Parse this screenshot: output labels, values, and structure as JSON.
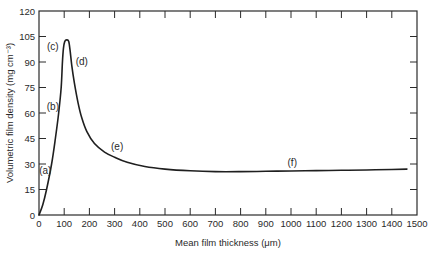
{
  "chart_data": {
    "type": "line",
    "title": "",
    "xlabel": "Mean film thickness (μm)",
    "ylabel": "Volumetric film density (mg cm⁻³)",
    "xlim": [
      0,
      1500
    ],
    "ylim": [
      0,
      120
    ],
    "xticks": [
      0,
      100,
      200,
      300,
      400,
      500,
      600,
      700,
      800,
      900,
      1000,
      1100,
      1200,
      1300,
      1400,
      1500
    ],
    "yticks": [
      0,
      15,
      30,
      45,
      60,
      75,
      90,
      105,
      120
    ],
    "xtick_labels": [
      "0",
      "100",
      "200",
      "300",
      "400",
      "500",
      "600",
      "700",
      "800",
      "900",
      "1000",
      "1100",
      "1200",
      "1300",
      "1400",
      "1500"
    ],
    "ytick_labels": [
      "0",
      "15",
      "30",
      "45",
      "60",
      "75",
      "90",
      "105",
      "120"
    ],
    "grid": false,
    "legend": null,
    "series": [
      {
        "name": "density",
        "x": [
          0,
          15,
          30,
          50,
          65,
          78,
          88,
          93,
          97,
          102,
          110,
          118,
          124,
          130,
          140,
          155,
          170,
          190,
          220,
          260,
          300,
          350,
          420,
          500,
          600,
          700,
          800,
          900,
          1000,
          1100,
          1200,
          1300,
          1400,
          1460
        ],
        "y": [
          0,
          6,
          15,
          30,
          45,
          60,
          75,
          90,
          98,
          102,
          103,
          102,
          96,
          88,
          78,
          66,
          57,
          49,
          42,
          37,
          34,
          31,
          28.5,
          27,
          26,
          25.5,
          25.5,
          25.7,
          25.9,
          26.1,
          26.3,
          26.5,
          26.8,
          27
        ]
      }
    ],
    "annotations": [
      {
        "text": "(a)",
        "x": 25,
        "y": 24
      },
      {
        "text": "(b)",
        "x": 55,
        "y": 62
      },
      {
        "text": "(c)",
        "x": 55,
        "y": 97
      },
      {
        "text": "(d)",
        "x": 170,
        "y": 88
      },
      {
        "text": "(e)",
        "x": 310,
        "y": 38
      },
      {
        "text": "(f)",
        "x": 1005,
        "y": 29
      }
    ]
  }
}
